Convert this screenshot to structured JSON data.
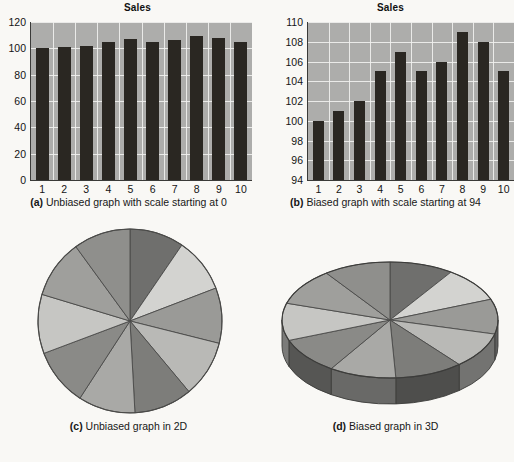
{
  "figure": {
    "background": "#f9f8f5",
    "bar_color": "#2a2722",
    "plot_background": "#adadab",
    "gridline_color": "#f1f1ee"
  },
  "panels": {
    "a": {
      "caption_label": "(a)",
      "caption_text": " Unbiased graph with scale starting at 0"
    },
    "b": {
      "caption_label": "(b)",
      "caption_text": " Biased graph with scale starting at 94"
    },
    "c": {
      "caption_label": "(c)",
      "caption_text": " Unbiased graph in 2D"
    },
    "d": {
      "caption_label": "(d)",
      "caption_text": " Biased graph in 3D"
    }
  },
  "chart_data": [
    {
      "type": "bar",
      "panel": "a",
      "title": "Sales",
      "xlabel": "",
      "ylabel": "",
      "categories": [
        "1",
        "2",
        "3",
        "4",
        "5",
        "6",
        "7",
        "8",
        "9",
        "10"
      ],
      "values": [
        100,
        101,
        102,
        105,
        107,
        105,
        106,
        109,
        108,
        105
      ],
      "ylim": [
        0,
        120
      ],
      "yticks": [
        0,
        20,
        40,
        60,
        80,
        100,
        120
      ],
      "grid": true,
      "legend": "none"
    },
    {
      "type": "bar",
      "panel": "b",
      "title": "Sales",
      "xlabel": "",
      "ylabel": "",
      "categories": [
        "1",
        "2",
        "3",
        "4",
        "5",
        "6",
        "7",
        "8",
        "9",
        "10"
      ],
      "values": [
        100,
        101,
        102,
        105,
        107,
        105,
        106,
        109,
        108,
        105
      ],
      "ylim": [
        94,
        110
      ],
      "yticks": [
        94,
        96,
        98,
        100,
        102,
        104,
        106,
        108,
        110
      ],
      "grid": true,
      "legend": "none"
    },
    {
      "type": "pie",
      "panel": "c",
      "title": "",
      "render": "2D",
      "labels": [
        "1",
        "2",
        "3",
        "4",
        "5",
        "6",
        "7",
        "8",
        "9",
        "10"
      ],
      "values": [
        100,
        101,
        102,
        105,
        107,
        105,
        106,
        109,
        108,
        105
      ],
      "slice_colors": [
        "#6f6f6d",
        "#d3d3d0",
        "#9a9a97",
        "#b9b9b6",
        "#7d7d7a",
        "#a9a9a6",
        "#8a8a87",
        "#c6c6c3",
        "#9f9f9c",
        "#8f8f8c"
      ],
      "legend": "none"
    },
    {
      "type": "pie",
      "panel": "d",
      "title": "",
      "render": "3D",
      "labels": [
        "1",
        "2",
        "3",
        "4",
        "5",
        "6",
        "7",
        "8",
        "9",
        "10"
      ],
      "values": [
        100,
        101,
        102,
        105,
        107,
        105,
        106,
        109,
        108,
        105
      ],
      "slice_colors": [
        "#6f6f6d",
        "#d3d3d0",
        "#9a9a97",
        "#b9b9b6",
        "#7d7d7a",
        "#a9a9a6",
        "#8a8a87",
        "#c6c6c3",
        "#9f9f9c",
        "#8f8f8c"
      ],
      "legend": "none"
    }
  ]
}
